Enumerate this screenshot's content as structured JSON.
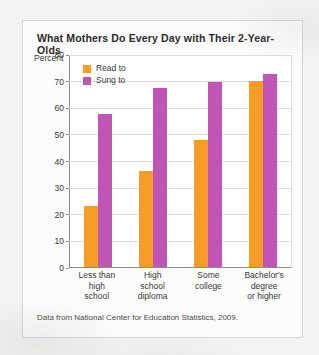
{
  "card": {
    "title": "What Mothers Do Every Day with Their 2-Year-Olds",
    "axis_unit": "Percent",
    "source_note": "Data from National Center for Education Statistics, 2009."
  },
  "colors": {
    "read_to": "#f89c28",
    "sung_to": "#c055b5",
    "grid": "#dcdcdc",
    "axis": "#8d8d8d",
    "page_background": "#f4f3f1",
    "card_background": "#fcfcfb"
  },
  "chart_data": {
    "type": "bar",
    "title": "What Mothers Do Every Day with Their 2-Year-Olds",
    "xlabel": "",
    "ylabel": "Percent",
    "ylim": [
      0,
      80
    ],
    "yticks": [
      0,
      10,
      20,
      30,
      40,
      50,
      60,
      70,
      80
    ],
    "ytick_labels": [
      "0",
      "10",
      "20",
      "30",
      "40",
      "50",
      "60",
      "70",
      "80"
    ],
    "grid": true,
    "legend_position": "top-left inside plot",
    "categories": [
      "Less than high school",
      "High school diploma",
      "Some college",
      "Bachelor's degree or higher"
    ],
    "category_lines": [
      [
        "Less than",
        "high",
        "school"
      ],
      [
        "High",
        "school",
        "diploma"
      ],
      [
        "Some",
        "college"
      ],
      [
        "Bachelor's",
        "degree",
        "or higher"
      ]
    ],
    "series": [
      {
        "name": "Read to",
        "color": "#f89c28",
        "values": [
          23,
          36.5,
          48,
          70.5
        ]
      },
      {
        "name": "Sung to",
        "color": "#c055b5",
        "values": [
          58,
          68,
          70,
          73
        ]
      }
    ],
    "annotations": [
      "Data from National Center for Education Statistics, 2009."
    ]
  }
}
